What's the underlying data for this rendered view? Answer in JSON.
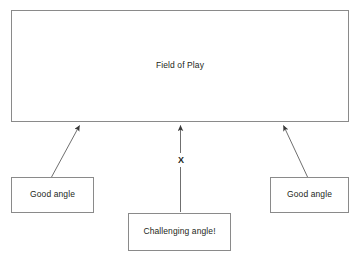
{
  "diagram": {
    "title_box": {
      "label": "Field of Play"
    },
    "boxes": [
      {
        "id": "good-angle-left",
        "label": "Good angle"
      },
      {
        "id": "challenging-angle",
        "label": "Challenging angle!"
      },
      {
        "id": "good-angle-right",
        "label": "Good angle"
      }
    ],
    "markers": {
      "blocked_marker": "X"
    },
    "colors": {
      "line": "#8a8a8a",
      "arrow": "#6f6f6f",
      "text": "#231f20",
      "background": "#ffffff",
      "marker": "#231f20"
    }
  }
}
